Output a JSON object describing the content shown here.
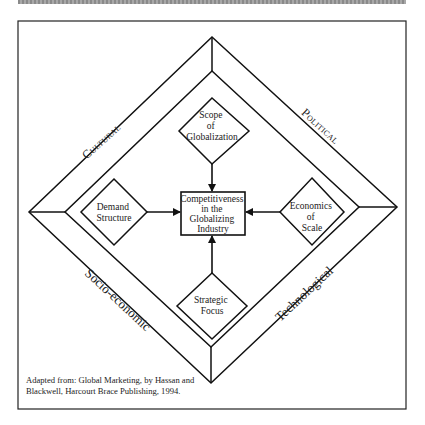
{
  "diagram": {
    "center": {
      "lines": [
        "Competitiveness",
        "in the",
        "Globalizing",
        "Industry"
      ]
    },
    "factors": {
      "top": {
        "lines": [
          "Scope",
          "of",
          "Globalization"
        ]
      },
      "left": {
        "lines": [
          "Demand",
          "Structure"
        ]
      },
      "right": {
        "lines": [
          "Economics",
          "of",
          "Scale"
        ]
      },
      "bottom": {
        "lines": [
          "Strategic",
          "Focus"
        ]
      }
    },
    "environments": {
      "top_left": "Cultural",
      "top_right": "Political",
      "bottom_left": "Socio-economic",
      "bottom_right": "Technological"
    },
    "source_note": [
      "Adapted from: Global Marketing, by Hassan and",
      "Blackwell, Harcourt Brace Publishing, 1994."
    ]
  }
}
